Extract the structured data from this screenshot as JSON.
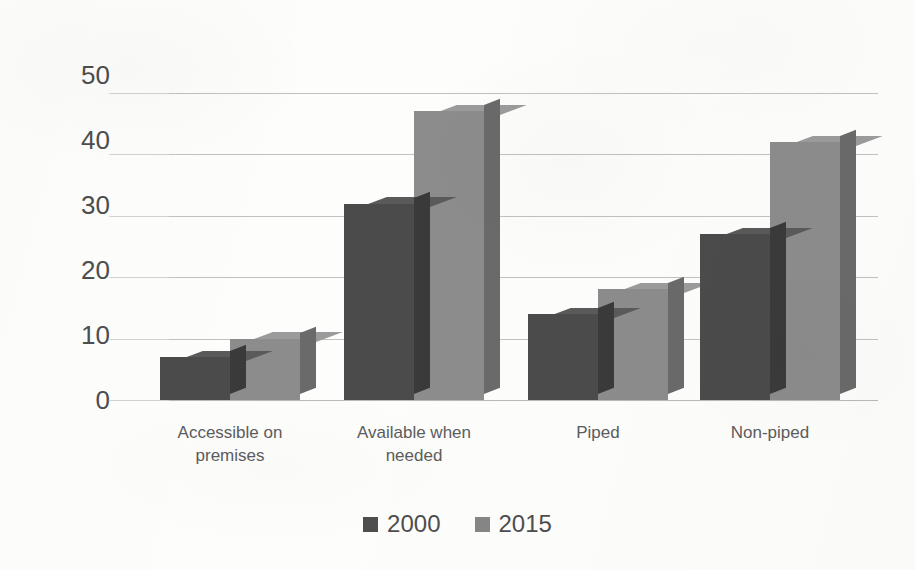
{
  "chart_data": {
    "type": "bar",
    "title": "",
    "subtitle": "",
    "xlabel": "",
    "ylabel": "Percentage",
    "ylim": [
      0,
      50
    ],
    "y_ticks": [
      50,
      40,
      30,
      20,
      10,
      0
    ],
    "grid": true,
    "three_d": true,
    "legend_position": "bottom-center",
    "categories": [
      "Accessible on premises",
      "Available when needed",
      "Piped",
      "Non-piped"
    ],
    "category_lines": [
      [
        "Accessible on",
        "premises"
      ],
      [
        "Available when",
        "needed"
      ],
      [
        "Piped"
      ],
      [
        "Non-piped"
      ]
    ],
    "series": [
      {
        "name": "2000",
        "color": "#4b4b4b",
        "values": [
          7,
          32,
          14,
          27
        ]
      },
      {
        "name": "2015",
        "color": "#8c8c8c",
        "values": [
          10,
          47,
          18,
          42
        ]
      }
    ]
  },
  "axis": {
    "y_title": "Percentage",
    "y_tick_labels": [
      "50",
      "40",
      "30",
      "20",
      "10",
      "0"
    ]
  },
  "legend": {
    "items": [
      {
        "label": "2000",
        "color": "#4e4e4e"
      },
      {
        "label": "2015",
        "color": "#868686"
      }
    ]
  },
  "colors": {
    "series_2000": "#4b4b4b",
    "series_2015": "#8c8c8c",
    "gridline": "#c2c2c2",
    "text": "#4d4d4d",
    "background": "#fdfdfc"
  }
}
